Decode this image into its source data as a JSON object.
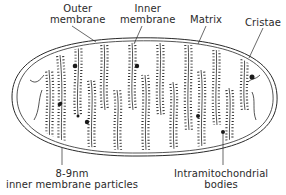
{
  "diagram": {
    "labels": {
      "outer_membrane": {
        "line1": "Outer",
        "line2": "membrane"
      },
      "inner_membrane": {
        "line1": "Inner",
        "line2": "membrane"
      },
      "matrix": {
        "line1": "Matrix"
      },
      "cristae": {
        "line1": "Cristae"
      },
      "particles": {
        "line1": "8-9nm",
        "line2": "inner membrane particles"
      },
      "bodies": {
        "line1": "Intramitochondrial",
        "line2": "bodies"
      }
    },
    "colors": {
      "stroke": "#2a2a2a",
      "background": "#ffffff"
    }
  }
}
